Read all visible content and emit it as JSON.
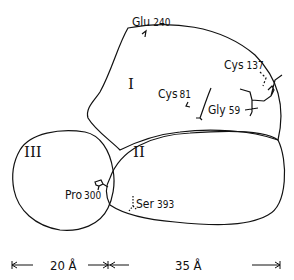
{
  "domains": [
    {
      "id": "domain-1",
      "label": "I"
    },
    {
      "id": "domain-2",
      "label": "II"
    },
    {
      "id": "domain-3",
      "label": "III"
    }
  ],
  "residues": [
    {
      "name": "Glu",
      "number": "240"
    },
    {
      "name": "Cys",
      "number": "137"
    },
    {
      "name": "Cys",
      "number": "81"
    },
    {
      "name": "Gly",
      "number": "59"
    },
    {
      "name": "Pro",
      "number": "300"
    },
    {
      "name": "Ser",
      "number": "393"
    }
  ],
  "scale": {
    "left": "20 Å",
    "right": "35 Å"
  },
  "colors": {
    "line": "#111111",
    "background": "#ffffff"
  }
}
